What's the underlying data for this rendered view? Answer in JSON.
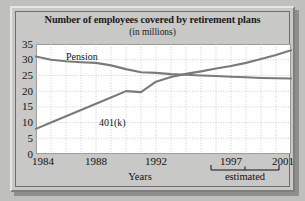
{
  "chart_data": {
    "type": "line",
    "title": "Number of employees covered by retirement plans",
    "subtitle": "(in millions)",
    "xlabel": "Years",
    "ylabel": "",
    "xlim": [
      1984,
      2001
    ],
    "ylim": [
      0,
      35
    ],
    "yticks": [
      0,
      5,
      10,
      15,
      20,
      25,
      30,
      35
    ],
    "xticks": [
      1984,
      1988,
      1992,
      1997,
      2001
    ],
    "grid": true,
    "legend_position": "inline-labels",
    "annotation": "estimated",
    "annotation_range": [
      1997,
      2001
    ],
    "x": [
      1984,
      1985,
      1986,
      1987,
      1988,
      1989,
      1990,
      1991,
      1992,
      1993,
      1994,
      1995,
      1996,
      1997,
      1998,
      1999,
      2000,
      2001
    ],
    "series": [
      {
        "name": "Pension",
        "values": [
          31,
          30,
          29.5,
          29.2,
          29,
          28.2,
          27,
          26,
          25.8,
          25.4,
          25.2,
          25,
          24.8,
          24.6,
          24.4,
          24.2,
          24.1,
          24
        ]
      },
      {
        "name": "401(k)",
        "values": [
          8,
          10,
          12,
          14,
          16,
          18,
          20,
          19.7,
          23,
          24.5,
          25.5,
          26.3,
          27.2,
          28,
          29,
          30.2,
          31.5,
          33
        ]
      }
    ]
  },
  "figure": {
    "title": "Number of employees covered by retirement plans",
    "subtitle": "(in millions)",
    "xaxis_title": "Years",
    "estimated_note": "estimated",
    "ytick_labels": [
      "35",
      "30",
      "25",
      "20",
      "15",
      "10",
      "5",
      "0"
    ],
    "xtick_labels": [
      "1984",
      "1988",
      "1992",
      "1997",
      "2001"
    ],
    "series_labels": {
      "pension": "Pension",
      "k401": "401(k)"
    }
  },
  "colors": {
    "line": "#7a7a78",
    "plot_background": "#ffffff",
    "panel_background": "#c8c8c6",
    "page_background": "#bfbfbd",
    "grid": "#b9b9b7",
    "text": "#111111"
  }
}
